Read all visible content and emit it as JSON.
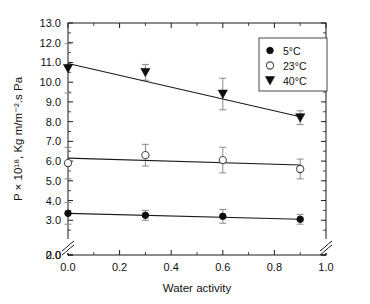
{
  "chart_data": {
    "type": "scatter",
    "title": "",
    "xlabel": "Water activity",
    "ylabel": "P × 10¹⁸, Kg m/m⁻².s Pa",
    "xlim": [
      0.0,
      1.0
    ],
    "ylim": [
      2.0,
      13.0
    ],
    "y_axis_break": true,
    "y_break_label": "0.0",
    "grid": false,
    "legend_position": "upper-right",
    "x": [
      0.0,
      0.3,
      0.6,
      0.9
    ],
    "xticks": [
      "0.0",
      "0.2",
      "0.4",
      "0.6",
      "0.8",
      "1.0"
    ],
    "xtick_values": [
      0.0,
      0.2,
      0.4,
      0.6,
      0.8,
      1.0
    ],
    "yticks": [
      "0.0",
      "2.0",
      "3.0",
      "4.0",
      "5.0",
      "6.0",
      "7.0",
      "8.0",
      "9.0",
      "10.0",
      "11.0",
      "12.0",
      "13.0"
    ],
    "ytick_values": [
      0.0,
      2.0,
      3.0,
      4.0,
      5.0,
      6.0,
      7.0,
      8.0,
      9.0,
      10.0,
      11.0,
      12.0,
      13.0
    ],
    "series": [
      {
        "name": "5°C",
        "marker": "filled-circle",
        "values": [
          3.35,
          3.25,
          3.2,
          3.05
        ],
        "errors": [
          0.55,
          0.25,
          0.35,
          0.25
        ],
        "fit_start": 3.35,
        "fit_end": 3.05
      },
      {
        "name": "23°C",
        "marker": "open-circle",
        "values": [
          5.9,
          6.3,
          6.05,
          5.6
        ],
        "errors": [
          0.8,
          0.55,
          0.65,
          0.5
        ],
        "fit_start": 6.15,
        "fit_end": 5.8
      },
      {
        "name": "40°C",
        "marker": "filled-triangle-down",
        "values": [
          10.7,
          10.5,
          9.4,
          8.2
        ],
        "errors": [
          1.25,
          0.4,
          0.8,
          0.35
        ],
        "fit_start": 10.95,
        "fit_end": 8.25
      }
    ]
  },
  "legend": {
    "items": [
      {
        "label": "5°C",
        "marker": "filled-circle"
      },
      {
        "label": "23°C",
        "marker": "open-circle"
      },
      {
        "label": "40°C",
        "marker": "filled-triangle-down"
      }
    ]
  },
  "colors": {
    "axis": "#1a1a1a",
    "marker_filled": "#0d0d0d",
    "marker_open_stroke": "#4d4d4d",
    "errorbar": "#8a8a8a",
    "background": "#ffffff"
  }
}
